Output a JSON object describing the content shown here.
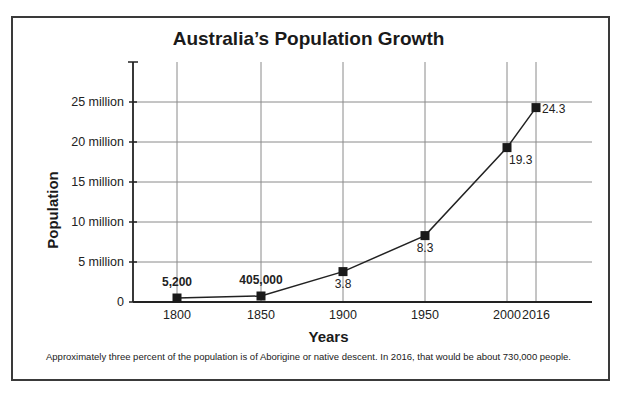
{
  "chart_data": {
    "type": "line",
    "title": "Australia’s Population Growth",
    "xlabel": "Years",
    "ylabel": "Population",
    "x": [
      1800,
      1850,
      1900,
      1950,
      2000,
      2016
    ],
    "values_millions": [
      0.0052,
      0.405,
      3.8,
      8.3,
      19.3,
      24.3
    ],
    "point_labels": [
      "5,200",
      "405,000",
      "3.8",
      "8.3",
      "19.3",
      "24.3"
    ],
    "x_tick_labels": [
      "1800",
      "1850",
      "1900",
      "1950",
      "2000",
      "2016"
    ],
    "y_tick_labels": [
      "0",
      "5 million",
      "10 million",
      "15 million",
      "20 million",
      "25 million"
    ],
    "y_ticks": [
      0,
      5,
      10,
      15,
      20,
      25
    ],
    "ylim": [
      0,
      30
    ],
    "grid": true,
    "legend": null,
    "footnote": "Approximately three percent of the population is of Aborigine or native descent.  In 2016, that would be about 730,000 people."
  }
}
